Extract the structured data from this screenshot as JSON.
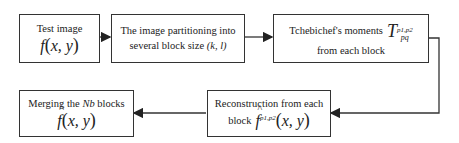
{
  "diagram": {
    "boxes": [
      {
        "id": "test-image",
        "line1": "Test image",
        "math": "f",
        "args": "x, y"
      },
      {
        "id": "partitioning",
        "line1": "The image partitioning into",
        "line2_prefix": "several block size ",
        "line2_italic": "(k, l)"
      },
      {
        "id": "tchebichef",
        "line1": "Tchebichef's moments",
        "symbol": "T",
        "superscript": "p1,p2",
        "subscript": "pq",
        "line2": "from each block"
      },
      {
        "id": "reconstruction",
        "line1": "Reconstruction from each",
        "line2_prefix": "block",
        "math": "f",
        "superscript": "p1,p2",
        "args": "x, y"
      },
      {
        "id": "merging",
        "line1_prefix": "Merging the ",
        "line1_italic": "Nb",
        "line1_suffix": " blocks",
        "math": "f",
        "args": "x, y"
      }
    ],
    "arrows": [
      {
        "from": "test-image",
        "to": "partitioning"
      },
      {
        "from": "partitioning",
        "to": "tchebichef"
      },
      {
        "from": "tchebichef",
        "to": "reconstruction"
      },
      {
        "from": "reconstruction",
        "to": "merging"
      }
    ],
    "colors": {
      "line": "#333333",
      "background": "#ffffff"
    }
  }
}
